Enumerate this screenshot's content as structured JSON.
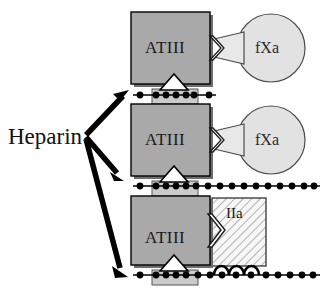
{
  "figure": {
    "title_text": "Heparin",
    "colors": {
      "atiii_fill": "#a8a8a8",
      "atiii_stroke": "#000000",
      "atiii_shadow": "#6e6e6e",
      "fxa_fill": "#e0e0e0",
      "fxa_stroke": "#555555",
      "iia_fill": "#f2f2f2",
      "iia_hatch": "#777777",
      "pentasaccharide_fill": "#cccccc",
      "chain_line": "#000000",
      "bead_fill": "#000000",
      "arrow_fill": "#000000",
      "background": "#ffffff"
    }
  },
  "labels": {
    "heparin": "Heparin",
    "atiii": "ATIII",
    "fxa": "fXa",
    "iia": "IIa"
  },
  "arrows": [
    {
      "name": "arrow-to-panel-1",
      "from": [
        86,
        134
      ],
      "to": [
        128,
        92
      ]
    },
    {
      "name": "arrow-to-panel-2",
      "from": [
        86,
        136
      ],
      "to": [
        124,
        179
      ]
    },
    {
      "name": "arrow-to-panel-3",
      "from": [
        86,
        138
      ],
      "to": [
        128,
        276
      ]
    }
  ],
  "panels": [
    {
      "id": "panel-1",
      "name": "short-heparin-fXa-inhibition",
      "atiii_label": "ATIII",
      "partner_label": "fXa",
      "partner_shape": "circle",
      "chain_bead_count": 7,
      "chain_length": "short",
      "chain_x_start": 133,
      "chain_x_end": 216,
      "chain_y": 95,
      "pentasaccharide": true,
      "iia_present": false
    },
    {
      "id": "panel-2",
      "name": "long-heparin-fXa-inhibition",
      "atiii_label": "ATIII",
      "partner_label": "fXa",
      "partner_shape": "circle",
      "chain_bead_count": 16,
      "chain_length": "long",
      "chain_x_start": 133,
      "chain_x_end": 320,
      "chain_y": 186,
      "pentasaccharide": true,
      "iia_present": false
    },
    {
      "id": "panel-3",
      "name": "long-heparin-IIa-bridging-inhibition",
      "atiii_label": "ATIII",
      "partner_label": "IIa",
      "partner_shape": "hatched-box",
      "chain_bead_count": 16,
      "chain_length": "long",
      "chain_x_start": 133,
      "chain_x_end": 320,
      "chain_y": 275,
      "pentasaccharide": true,
      "iia_present": true,
      "iia_arch_count": 3
    }
  ]
}
